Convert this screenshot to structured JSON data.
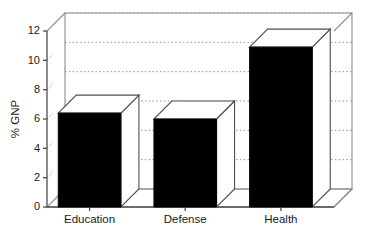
{
  "chart_data": {
    "type": "bar",
    "title": "",
    "subtitle": "",
    "xlabel": "",
    "ylabel": "% GNP",
    "categories": [
      "Education",
      "Defense",
      "Health"
    ],
    "values": [
      6.4,
      6.0,
      10.9
    ],
    "series": [
      {
        "name": "% GNP",
        "values": [
          6.4,
          6.0,
          10.9
        ]
      }
    ],
    "ylim": [
      0,
      12
    ],
    "yticks": [
      0,
      2,
      4,
      6,
      8,
      10,
      12
    ],
    "ytick_labels": [
      "0",
      "2",
      "4",
      "6",
      "8",
      "10",
      "12"
    ],
    "grid": true,
    "grid_axis": "y",
    "grid_style": "dotted",
    "legend": false,
    "legend_position": "none",
    "rendering": "3d-bar",
    "bar_face_color": "#000000",
    "bar_top_color": "#ffffff",
    "bar_side_color": "#ffffff",
    "background_color": "#ffffff",
    "axis_color": "#4d4d4d",
    "gridline_color": "#9a9a9a",
    "annotations": []
  }
}
